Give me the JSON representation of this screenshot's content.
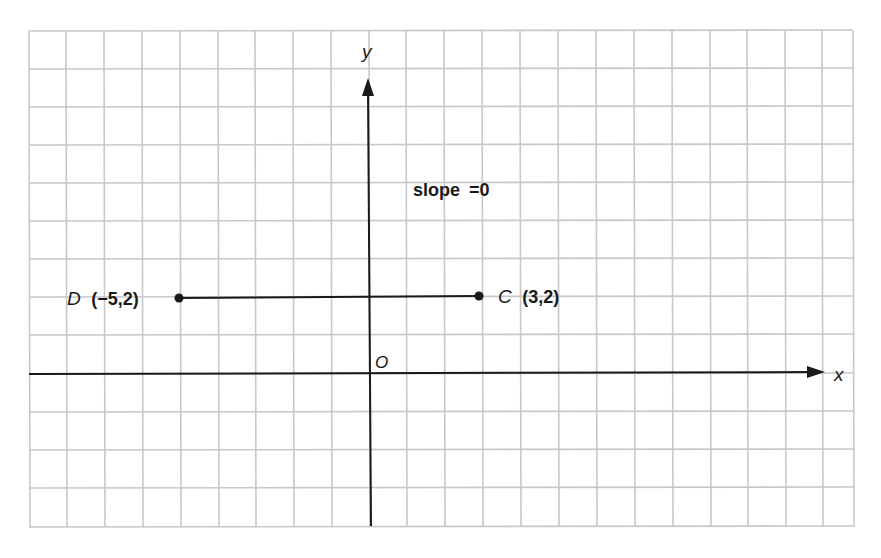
{
  "chart_data": {
    "type": "scatter",
    "title": "",
    "xlabel": "x",
    "ylabel": "y",
    "origin_label": "O",
    "grid": true,
    "xlim": [
      -9,
      13
    ],
    "ylim": [
      -4,
      9
    ],
    "points": [
      {
        "name": "D",
        "x": -5,
        "y": 2,
        "label": "(−5,2)"
      },
      {
        "name": "C",
        "x": 3,
        "y": 2,
        "label": "(3,2)"
      }
    ],
    "segments": [
      {
        "from": "D",
        "to": "C"
      }
    ],
    "annotations": [
      {
        "text": "slope =0",
        "x": 1,
        "y": 5
      }
    ]
  },
  "labels": {
    "y_axis": "y",
    "x_axis": "x",
    "origin": "O",
    "slope_text": "slope",
    "slope_eq": "=0",
    "point_d_name": "D",
    "point_d_coords": "(−5,2)",
    "point_c_name": "C",
    "point_c_coords": "(3,2)"
  },
  "colors": {
    "grid": "#c8c8c8",
    "axis": "#1a1a1a",
    "background": "#ffffff"
  }
}
